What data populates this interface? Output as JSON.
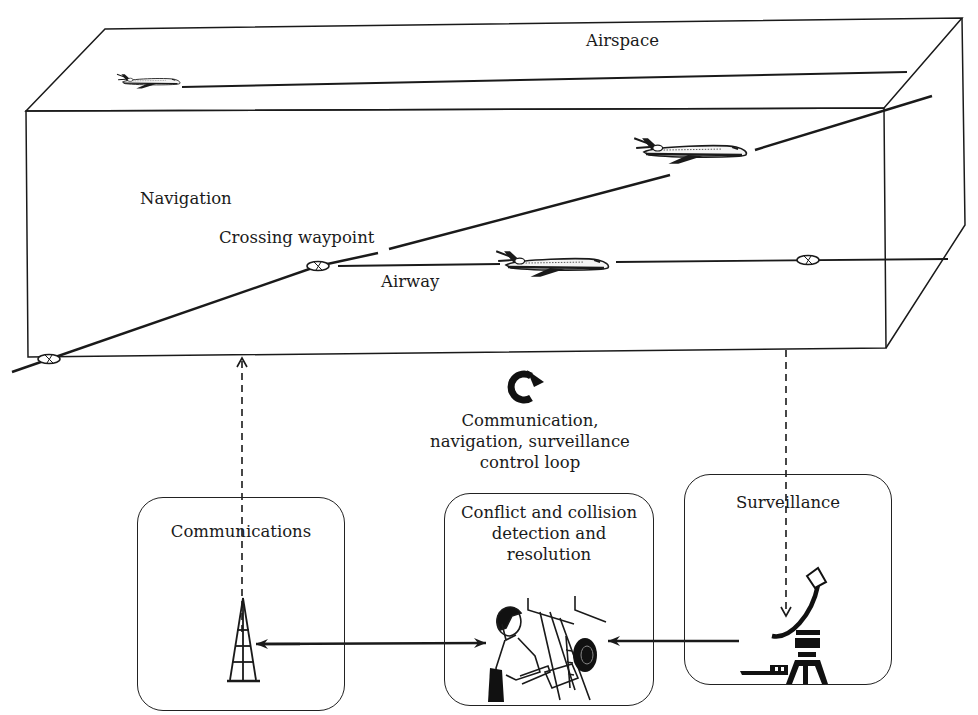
{
  "diagram": {
    "airspace": {
      "label": "Airspace"
    },
    "labels": {
      "navigation": "Navigation",
      "crossing_waypoint": "Crossing waypoint",
      "airway": "Airway"
    },
    "control_loop": {
      "icon": "circular-arrow-icon",
      "line1": "Communication,",
      "line2": "navigation, surveillance",
      "line3": "control loop"
    },
    "boxes": [
      {
        "id": "communications",
        "label_lines": [
          "Communications"
        ],
        "icon": "radio-tower-icon"
      },
      {
        "id": "conflict",
        "label_lines": [
          "Conflict and collision",
          "detection and",
          "resolution"
        ],
        "icon": "air-traffic-controller-icon"
      },
      {
        "id": "surveillance",
        "label_lines": [
          "Surveillance"
        ],
        "icon": "radar-antenna-icon"
      }
    ],
    "aircraft": [
      {
        "id": "aircraft-top",
        "position": "top airway on airspace roof"
      },
      {
        "id": "aircraft-climbing",
        "position": "crossing route, right"
      },
      {
        "id": "aircraft-airway",
        "position": "airway, middle"
      }
    ],
    "waypoints": [
      {
        "id": "waypoint-left-entry"
      },
      {
        "id": "waypoint-crossing"
      },
      {
        "id": "waypoint-right"
      }
    ],
    "colors": {
      "stroke": "#1a1a1a",
      "background": "#ffffff"
    }
  }
}
